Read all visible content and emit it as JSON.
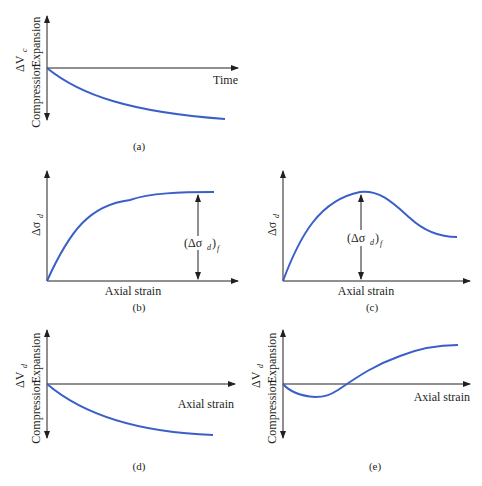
{
  "figure": {
    "panels": [
      {
        "id": "a",
        "caption": "(a)",
        "ylabel": "ΔV_c",
        "ylabel_main": "ΔV",
        "ylabel_sub": "c",
        "y_pos_label": "Expansion",
        "y_neg_label": "Compression",
        "xlabel": "Time",
        "curve": "monotonic decrease approaching asymptote"
      },
      {
        "id": "b",
        "caption": "(b)",
        "ylabel": "Δσ_d",
        "ylabel_main": "Δσ",
        "ylabel_sub": "d",
        "xlabel": "Axial strain",
        "annotation": "(Δσd)f",
        "annotation_main": "(Δσ",
        "annotation_sub": "d",
        "annotation_tail": ")",
        "annotation_sub2": "f",
        "curve": "rises and plateaus"
      },
      {
        "id": "c",
        "caption": "(c)",
        "ylabel": "Δσ_d",
        "ylabel_main": "Δσ",
        "ylabel_sub": "d",
        "xlabel": "Axial strain",
        "annotation": "(Δσd)f",
        "annotation_main": "(Δσ",
        "annotation_sub": "d",
        "annotation_tail": ")",
        "annotation_sub2": "f",
        "curve": "rises to peak then softens"
      },
      {
        "id": "d",
        "caption": "(d)",
        "ylabel": "ΔV_d",
        "ylabel_main": "ΔV",
        "ylabel_sub": "d",
        "y_pos_label": "Expansion",
        "y_neg_label": "Compression",
        "xlabel": "Axial strain",
        "curve": "monotonic compression"
      },
      {
        "id": "e",
        "caption": "(e)",
        "ylabel": "ΔV_d",
        "ylabel_main": "ΔV",
        "ylabel_sub": "d",
        "y_pos_label": "Expansion",
        "y_neg_label": "Compression",
        "xlabel": "Axial strain",
        "curve": "initial compression then expansion (dilation)"
      }
    ]
  },
  "colors": {
    "curve": "#3a5fc8",
    "axis": "#231f20",
    "text": "#231f20"
  }
}
